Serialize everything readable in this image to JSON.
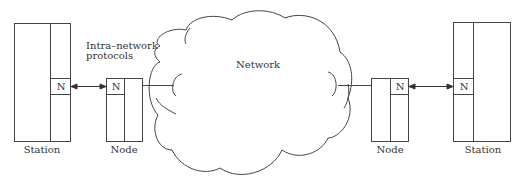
{
  "diagram": {
    "network_label": "Network",
    "protocol_annotation": {
      "line1": "Intra–network",
      "line2": "protocols"
    },
    "left_station": {
      "label": "Station",
      "layer_label": "N"
    },
    "left_node": {
      "label": "Node",
      "layer_label": "N"
    },
    "right_node": {
      "label": "Node",
      "layer_label": "N"
    },
    "right_station": {
      "label": "Station",
      "layer_label": "N"
    },
    "colors": {
      "line": "#444444",
      "text": "#333333",
      "background": "#ffffff"
    }
  }
}
